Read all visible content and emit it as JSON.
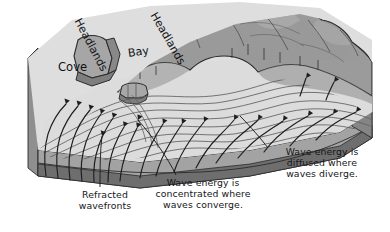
{
  "figure": {
    "type": "diagram"
  },
  "palette": {
    "paper": "#ffffff",
    "land_top": "#9a9a9a",
    "land_shadow": "#8a8a8a",
    "land_highlight": "#b3b3b3",
    "water_surface": "#d7d7d7",
    "water_light": "#e3e3e3",
    "block_side_upper": "#9c9c9c",
    "block_side_lower": "#7b7b7b",
    "block_front_upper": "#a5a5a5",
    "block_front_lower": "#6f6f6f",
    "line": "#2b2b2b",
    "wavefront_line": "#5d5d5d",
    "text": "#16161a"
  },
  "map_labels": [
    {
      "id": "cove",
      "text": "Cove",
      "rotation_deg": 0
    },
    {
      "id": "bay",
      "text": "Bay",
      "rotation_deg": -8
    },
    {
      "id": "headlands_left",
      "text": "Headlands",
      "rotation_deg": 62
    },
    {
      "id": "headlands_right",
      "text": "Headlands",
      "rotation_deg": 60
    }
  ],
  "captions": [
    {
      "id": "refracted_wavefronts",
      "text": "Refracted\nwavefronts",
      "lines": [
        "Refracted",
        "wavefronts"
      ],
      "has_leader_line": true
    },
    {
      "id": "energy_concentrated",
      "text": "Wave energy is\nconcentrated where\nwaves converge.",
      "lines": [
        "Wave energy is",
        "concentrated where",
        "waves converge."
      ],
      "has_leader_line": true
    },
    {
      "id": "energy_diffused",
      "text": "Wave energy is\ndiffused where\nwaves diverge.",
      "lines": [
        "Wave energy is",
        "diffused where",
        "waves diverge."
      ],
      "has_leader_line": true
    }
  ],
  "features": {
    "wavefront_count": 9,
    "orthogonal_arrow_count": 18,
    "sea_stack_present": true,
    "headland_count": 2,
    "bay_count": 1,
    "cove_count": 1
  }
}
